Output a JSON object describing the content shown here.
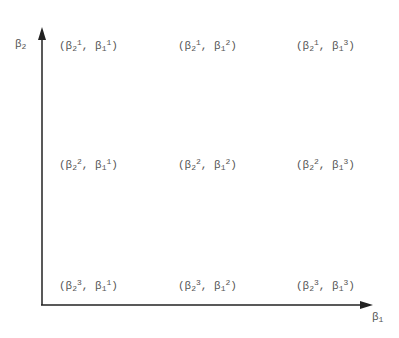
{
  "axes": {
    "y_label": {
      "base": "β",
      "sub": "2"
    },
    "x_label": {
      "base": "β",
      "sub": "1"
    },
    "color": "#222222"
  },
  "grid": {
    "rows": [
      {
        "cells": [
          {
            "a_base": "β",
            "a_sub": "2",
            "a_sup": "1",
            "b_base": "β",
            "b_sub": "1",
            "b_sup": "1"
          },
          {
            "a_base": "β",
            "a_sub": "2",
            "a_sup": "1",
            "b_base": "β",
            "b_sub": "1",
            "b_sup": "2"
          },
          {
            "a_base": "β",
            "a_sub": "2",
            "a_sup": "1",
            "b_base": "β",
            "b_sub": "1",
            "b_sup": "3"
          }
        ]
      },
      {
        "cells": [
          {
            "a_base": "β",
            "a_sub": "2",
            "a_sup": "2",
            "b_base": "β",
            "b_sub": "1",
            "b_sup": "1"
          },
          {
            "a_base": "β",
            "a_sub": "2",
            "a_sup": "2",
            "b_base": "β",
            "b_sub": "1",
            "b_sup": "2"
          },
          {
            "a_base": "β",
            "a_sub": "2",
            "a_sup": "2",
            "b_base": "β",
            "b_sub": "1",
            "b_sup": "3"
          }
        ]
      },
      {
        "cells": [
          {
            "a_base": "β",
            "a_sub": "2",
            "a_sup": "3",
            "b_base": "β",
            "b_sub": "1",
            "b_sup": "1"
          },
          {
            "a_base": "β",
            "a_sub": "2",
            "a_sup": "3",
            "b_base": "β",
            "b_sub": "1",
            "b_sup": "2"
          },
          {
            "a_base": "β",
            "a_sub": "2",
            "a_sup": "3",
            "b_base": "β",
            "b_sub": "1",
            "b_sup": "3"
          }
        ]
      }
    ],
    "open": "(",
    "sep": ", ",
    "close": ")"
  }
}
